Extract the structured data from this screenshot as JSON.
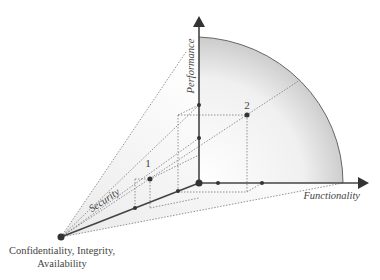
{
  "diagram": {
    "axes": {
      "performance": "Performance",
      "functionality": "Functionality",
      "security": "Security",
      "origin_label_line1": "Confidentiality, Integrity,",
      "origin_label_line2": "Availability"
    },
    "points": [
      {
        "id": "1",
        "label": "1"
      },
      {
        "id": "2",
        "label": "2"
      }
    ],
    "colors": {
      "axis": "#444444",
      "dashed": "#777777",
      "fill_light": "#f4f4f4",
      "fill_dark": "#cfcfcf"
    }
  }
}
